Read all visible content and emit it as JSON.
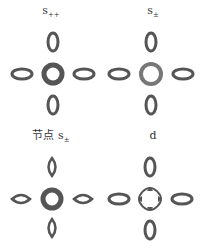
{
  "figure": {
    "stroke_color": "#555555",
    "panels": [
      {
        "id": "s_pp",
        "label_main": "s",
        "label_sub": "++",
        "label_prefix": "",
        "center": "ring-thick",
        "satellites": "ellipse"
      },
      {
        "id": "s_pm",
        "label_main": "s",
        "label_sub": "±",
        "label_prefix": "",
        "center": "ring",
        "satellites": "ellipse"
      },
      {
        "id": "nodal_s_pm",
        "label_main": "s",
        "label_sub": "±",
        "label_prefix": "节点 ",
        "center": "ring-thick",
        "satellites": "lens"
      },
      {
        "id": "d",
        "label_main": "d",
        "label_sub": "",
        "label_prefix": "",
        "center": "four-lobe",
        "satellites": "ellipse"
      }
    ]
  }
}
